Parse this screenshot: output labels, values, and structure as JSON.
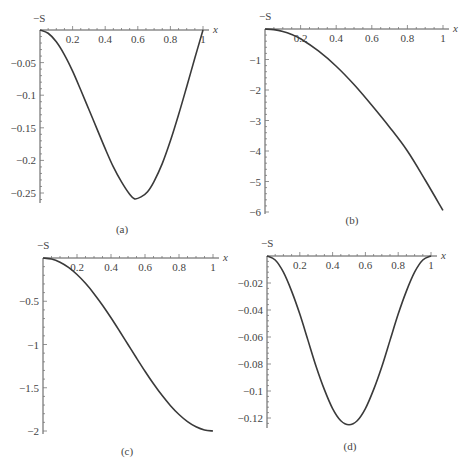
{
  "chart_data": [
    {
      "panel": "(a)",
      "type": "line",
      "ylabel": "−S",
      "xlabel": "x",
      "caption": "(a)",
      "xlim": [
        0,
        1
      ],
      "ylim": [
        -0.265,
        0
      ],
      "xticks": [
        0.2,
        0.4,
        0.6,
        0.8,
        1
      ],
      "xtick_labels": [
        "0.2",
        "0.4",
        "0.6",
        "0.8",
        "1"
      ],
      "yticks": [
        -0.05,
        -0.1,
        -0.15,
        -0.2,
        -0.25
      ],
      "ytick_labels": [
        "−0.05",
        "−0.1",
        "−0.15",
        "−0.2",
        "−0.25"
      ],
      "x": [
        0,
        0.05,
        0.1,
        0.15,
        0.2,
        0.25,
        0.3,
        0.35,
        0.4,
        0.45,
        0.5,
        0.55,
        0.58,
        0.62,
        0.66,
        0.7,
        0.75,
        0.8,
        0.85,
        0.9,
        0.95,
        1
      ],
      "y": [
        0,
        -0.005,
        -0.018,
        -0.038,
        -0.063,
        -0.092,
        -0.122,
        -0.152,
        -0.182,
        -0.21,
        -0.233,
        -0.252,
        -0.259,
        -0.256,
        -0.248,
        -0.232,
        -0.205,
        -0.17,
        -0.13,
        -0.087,
        -0.043,
        0
      ]
    },
    {
      "panel": "(b)",
      "type": "line",
      "ylabel": "−S",
      "xlabel": "x",
      "caption": "(b)",
      "xlim": [
        0,
        1
      ],
      "ylim": [
        -6.1,
        0
      ],
      "xticks": [
        0.2,
        0.4,
        0.6,
        0.8,
        1
      ],
      "xtick_labels": [
        "0.2",
        "0.4",
        "0.6",
        "0.8",
        "1"
      ],
      "yticks": [
        -1,
        -2,
        -3,
        -4,
        -5,
        -6
      ],
      "ytick_labels": [
        "−1",
        "−2",
        "−3",
        "−4",
        "−5",
        "−6"
      ],
      "x": [
        0,
        0.05,
        0.1,
        0.15,
        0.2,
        0.3,
        0.4,
        0.5,
        0.6,
        0.7,
        0.8,
        0.9,
        1
      ],
      "y": [
        0,
        -0.02,
        -0.08,
        -0.18,
        -0.32,
        -0.72,
        -1.22,
        -1.82,
        -2.5,
        -3.22,
        -4.0,
        -4.95,
        -5.95
      ]
    },
    {
      "panel": "(c)",
      "type": "line",
      "ylabel": "−S",
      "xlabel": "x",
      "caption": "(c)",
      "xlim": [
        0,
        1
      ],
      "ylim": [
        -2.05,
        0
      ],
      "xticks": [
        0.2,
        0.4,
        0.6,
        0.8,
        1
      ],
      "xtick_labels": [
        "0.2",
        "0.4",
        "0.6",
        "0.8",
        "1"
      ],
      "yticks": [
        -0.5,
        -1,
        -1.5,
        -2
      ],
      "ytick_labels": [
        "−0.5",
        "−1",
        "−1.5",
        "−2"
      ],
      "x": [
        0,
        0.05,
        0.1,
        0.15,
        0.2,
        0.25,
        0.3,
        0.35,
        0.4,
        0.45,
        0.5,
        0.55,
        0.6,
        0.65,
        0.7,
        0.75,
        0.8,
        0.85,
        0.9,
        0.95,
        1
      ],
      "y": [
        0,
        -0.012,
        -0.049,
        -0.109,
        -0.191,
        -0.293,
        -0.412,
        -0.546,
        -0.691,
        -0.844,
        -1.0,
        -1.156,
        -1.309,
        -1.454,
        -1.588,
        -1.707,
        -1.809,
        -1.891,
        -1.951,
        -1.988,
        -2.0
      ]
    },
    {
      "panel": "(d)",
      "type": "line",
      "ylabel": "−S",
      "xlabel": "x",
      "caption": "(d)",
      "xlim": [
        0,
        1
      ],
      "ylim": [
        -0.128,
        0
      ],
      "xticks": [
        0.2,
        0.4,
        0.6,
        0.8,
        1
      ],
      "xtick_labels": [
        "0.2",
        "0.4",
        "0.6",
        "0.8",
        "1"
      ],
      "yticks": [
        -0.02,
        -0.04,
        -0.06,
        -0.08,
        -0.1,
        -0.12
      ],
      "ytick_labels": [
        "−0.02",
        "−0.04",
        "−0.06",
        "−0.08",
        "−0.1",
        "−0.12"
      ],
      "x": [
        0,
        0.05,
        0.1,
        0.15,
        0.2,
        0.25,
        0.3,
        0.35,
        0.4,
        0.45,
        0.5,
        0.55,
        0.6,
        0.65,
        0.7,
        0.75,
        0.8,
        0.85,
        0.9,
        0.95,
        1
      ],
      "y": [
        0,
        -0.003,
        -0.012,
        -0.026,
        -0.043,
        -0.0625,
        -0.082,
        -0.099,
        -0.113,
        -0.122,
        -0.125,
        -0.122,
        -0.113,
        -0.099,
        -0.082,
        -0.0625,
        -0.043,
        -0.026,
        -0.012,
        -0.003,
        0
      ]
    }
  ],
  "layout": {
    "panels": [
      {
        "x0": 40,
        "x1": 203,
        "y0": 30,
        "yscale_px_per_unit": 652,
        "yaxis_end": 203,
        "caption_pos": [
          122,
          233
        ],
        "s_label_pos": [
          33,
          22
        ]
      },
      {
        "x0": 265,
        "x1": 443,
        "y0": 29,
        "yscale_px_per_unit": 30.5,
        "yaxis_end": 214,
        "caption_pos": [
          352,
          224
        ],
        "s_label_pos": [
          259,
          20
        ]
      },
      {
        "x0": 43,
        "x1": 213,
        "y0": 258,
        "yscale_px_per_unit": 86.5,
        "yaxis_end": 434,
        "caption_pos": [
          127,
          455
        ],
        "s_label_pos": [
          37,
          249
        ]
      },
      {
        "x0": 267,
        "x1": 431,
        "y0": 256,
        "yscale_px_per_unit": 1350,
        "yaxis_end": 428,
        "caption_pos": [
          350,
          450
        ],
        "s_label_pos": [
          261,
          247
        ]
      }
    ]
  }
}
